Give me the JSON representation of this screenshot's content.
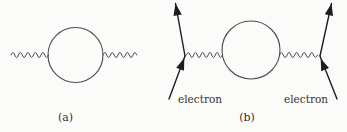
{
  "colors": {
    "background": "#fbfbf9",
    "line": "#4c4c4c",
    "arrow": "#1d1d1d",
    "text": "#333333"
  },
  "diagram_a": {
    "caption": "(a)"
  },
  "diagram_b": {
    "caption": "(b)",
    "left_electron_label": "electron",
    "right_electron_label": "electron"
  }
}
